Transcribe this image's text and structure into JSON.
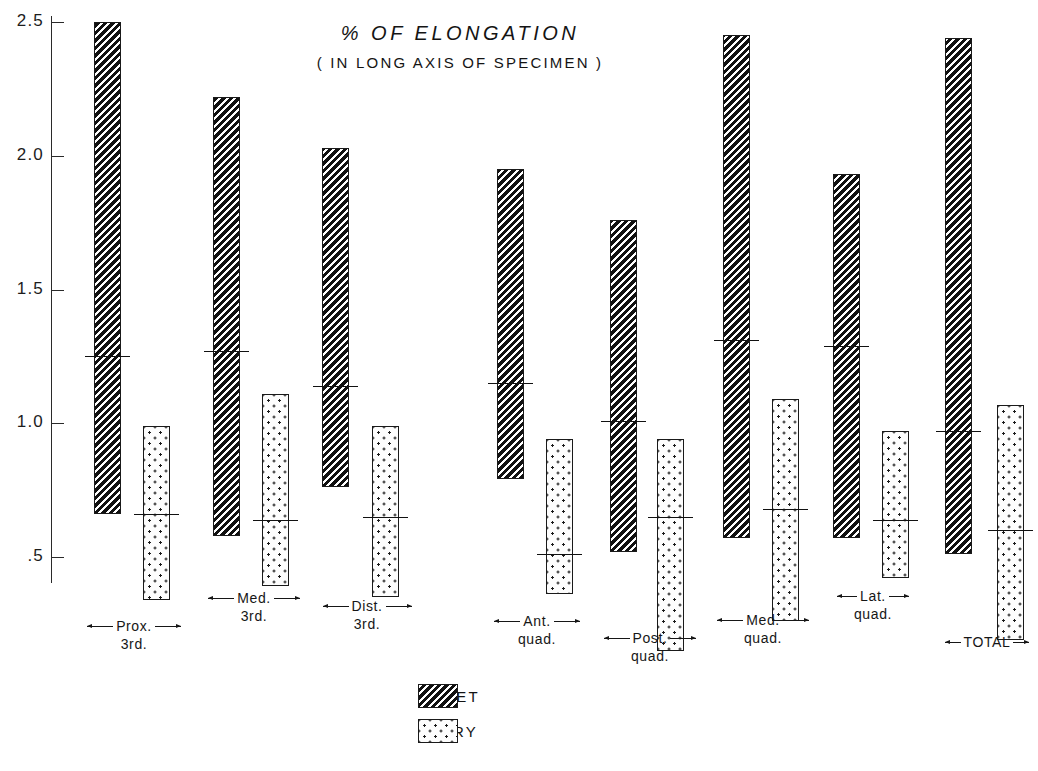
{
  "chart_data": {
    "type": "bar",
    "title": "% OF ELONGATION",
    "subtitle": "( IN LONG AXIS OF SPECIMEN )",
    "xlabel": "",
    "ylabel": "",
    "ylim": [
      0.35,
      2.62
    ],
    "grid": false,
    "legend_position": "bottom-center",
    "y_ticks": [
      {
        "value": 2.5,
        "label": "2.5"
      },
      {
        "value": 2.0,
        "label": "2.0"
      },
      {
        "value": 1.5,
        "label": "1.5"
      },
      {
        "value": 1.0,
        "label": "1.0"
      },
      {
        "value": 0.5,
        "label": ".5"
      }
    ],
    "categories": [
      "Prox. 3rd.",
      "Med. 3rd.",
      "Dist. 3rd.",
      "Ant. quad.",
      "Post. quad.",
      "Med. quad.",
      "Lat. quad.",
      "TOTAL"
    ],
    "category_labels": [
      {
        "line1": "Prox.",
        "line2": "3rd."
      },
      {
        "line1": "Med.",
        "line2": "3rd."
      },
      {
        "line1": "Dist.",
        "line2": "3rd."
      },
      {
        "line1": "Ant.",
        "line2": "quad."
      },
      {
        "line1": "Post.",
        "line2": "quad."
      },
      {
        "line1": "Med.",
        "line2": "quad."
      },
      {
        "line1": "Lat.",
        "line2": "quad."
      },
      {
        "line1": "TOTAL",
        "line2": ""
      }
    ],
    "series": [
      {
        "name": "WET",
        "fill": "diagonal-hatch",
        "max": [
          2.5,
          2.22,
          2.03,
          1.95,
          1.76,
          2.45,
          1.93,
          2.44
        ],
        "min": [
          0.66,
          0.58,
          0.76,
          0.79,
          0.52,
          0.57,
          0.57,
          0.51
        ],
        "mean": [
          1.25,
          1.27,
          1.14,
          1.15,
          1.01,
          1.31,
          1.29,
          0.97
        ]
      },
      {
        "name": "DRY",
        "fill": "stipple-dots",
        "max": [
          0.99,
          1.11,
          0.99,
          0.94,
          0.94,
          1.09,
          0.97,
          1.07
        ],
        "min": [
          0.34,
          0.39,
          0.35,
          0.36,
          0.15,
          0.26,
          0.42,
          0.19
        ],
        "mean": [
          0.66,
          0.64,
          0.65,
          0.51,
          0.65,
          0.68,
          0.64,
          0.6
        ]
      }
    ]
  },
  "legend": {
    "items": [
      {
        "label": "WET",
        "fill": "diagonal-hatch"
      },
      {
        "label": "DRY",
        "fill": "stipple-dots"
      }
    ]
  },
  "colors": {
    "ink": "#1a1a1a",
    "background": "#ffffff"
  }
}
